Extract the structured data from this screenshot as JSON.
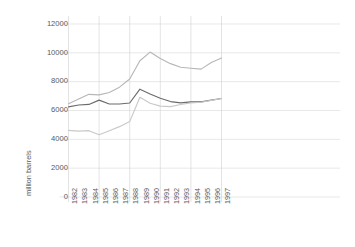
{
  "chart_data": {
    "type": "line",
    "title": "",
    "xlabel": "",
    "ylabel": "million barrels",
    "x": [
      "1982",
      "1983",
      "1984",
      "1985",
      "1986",
      "1987",
      "1988",
      "1989",
      "1990",
      "1991",
      "1992",
      "1993",
      "1994",
      "1995",
      "1996",
      "1997"
    ],
    "categories": [
      "1982",
      "1983",
      "1984",
      "1985",
      "1986",
      "1987",
      "1988",
      "1989",
      "1990",
      "1991",
      "1992",
      "1993",
      "1994",
      "1995",
      "1996",
      "1997"
    ],
    "ylim": [
      0,
      12000
    ],
    "yticks": [
      0,
      2000,
      4000,
      6000,
      8000,
      10000,
      12000
    ],
    "ytick_labels": [
      "0",
      "2000",
      "4000",
      "6000",
      "8000",
      "10000",
      "12000"
    ],
    "grid": true,
    "legend": "none",
    "series": [
      {
        "name": "series-1",
        "color": "#6b6b6b",
        "values": [
          6250,
          6380,
          6420,
          6720,
          6450,
          6450,
          6520,
          7480,
          7150,
          6850,
          6620,
          6530,
          6600,
          6600,
          6720,
          6830
        ]
      },
      {
        "name": "series-2",
        "color": "#b7b7b7",
        "values": [
          6470,
          6800,
          7120,
          7080,
          7250,
          7620,
          8180,
          9450,
          10050,
          9600,
          9250,
          9000,
          8930,
          8870,
          9330,
          9640
        ]
      },
      {
        "name": "series-3",
        "color": "#c9c9c9",
        "values": [
          4620,
          4570,
          4600,
          4320,
          4600,
          4880,
          5230,
          6920,
          6500,
          6300,
          6270,
          6420,
          6520,
          6570,
          6700,
          6830
        ]
      }
    ]
  },
  "axis": {
    "y_title": "million barrels"
  }
}
